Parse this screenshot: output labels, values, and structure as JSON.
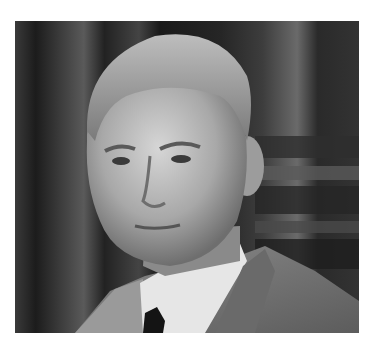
{
  "image": {
    "alt": "Black-and-white portrait photograph of an elderly man with short gray hair, wearing a suit jacket, white collared shirt and dark tie, against a dark curtain background",
    "colors": {
      "page_background": "#ffffff",
      "curtain_dark": "#1e1e1e",
      "curtain_highlight": "#6a6a6a",
      "skin": "#b8b8b8",
      "hair": "#9a9a9a",
      "jacket": "#7a7a7a",
      "shirt": "#e8e8e8",
      "tie": "#141414"
    }
  }
}
